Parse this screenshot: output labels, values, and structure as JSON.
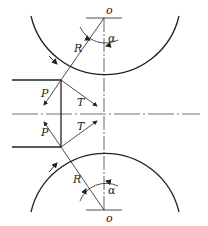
{
  "diagram": {
    "title": "",
    "labels": {
      "top_center": "o",
      "bottom_center": "o",
      "top_radius": "R",
      "bottom_radius": "R",
      "top_angle": "α",
      "bottom_angle": "α",
      "top_force_p": "P",
      "bottom_force_p": "P",
      "top_force_t": "T",
      "bottom_force_t": "T"
    },
    "colors": {
      "stroke": "#222222",
      "background": "#ffffff"
    }
  }
}
